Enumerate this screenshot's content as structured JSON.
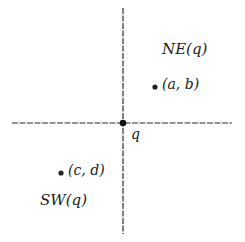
{
  "diagram": {
    "type": "quadrant-partition",
    "colors": {
      "ink": "#1a1a1a",
      "axis": "#2a2a2a",
      "background": "#ffffff"
    },
    "origin": {
      "label": "q"
    },
    "regions": [
      {
        "id": "ne",
        "label": "NE(q)"
      },
      {
        "id": "sw",
        "label": "SW(q)"
      }
    ],
    "points": [
      {
        "id": "ab",
        "label": "(a, b)",
        "region": "ne"
      },
      {
        "id": "cd",
        "label": "(c, d)",
        "region": "sw"
      }
    ]
  }
}
